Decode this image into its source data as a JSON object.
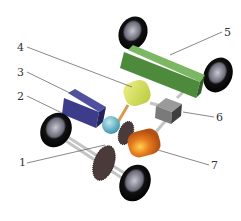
{
  "diagram": {
    "labels": [
      {
        "id": "1",
        "text": "1",
        "x": 19,
        "y": 157
      },
      {
        "id": "2",
        "text": "2",
        "x": 17,
        "y": 91
      },
      {
        "id": "3",
        "text": "3",
        "x": 17,
        "y": 67
      },
      {
        "id": "4",
        "text": "4",
        "x": 17,
        "y": 42
      },
      {
        "id": "5",
        "text": "5",
        "x": 224,
        "y": 27
      },
      {
        "id": "6",
        "text": "6",
        "x": 216,
        "y": 112
      },
      {
        "id": "7",
        "text": "7",
        "x": 211,
        "y": 160
      }
    ],
    "colors": {
      "green_box": "#4e8a3c",
      "green_top": "#69a653",
      "yellow_cyl": "#d8e25a",
      "blue_box": "#3c3c8a",
      "sphere": "#6cbfd2",
      "grey_box": "#7a7a7a",
      "orange_cyl": "#e07a24",
      "tire": "#111111",
      "axle": "#c8c8c8",
      "leader": "#555555"
    }
  }
}
